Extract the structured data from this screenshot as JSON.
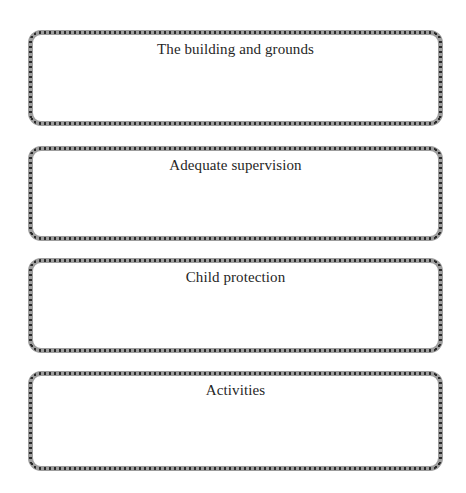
{
  "page": {
    "background_color": "#ffffff",
    "width": 466,
    "height": 493
  },
  "style": {
    "border_band_color": "#9d9d9d",
    "border_dot_color": "#2b2b2b",
    "text_color": "#262626",
    "box_fill_color": "#ffffff"
  },
  "boxes": [
    {
      "label": "The building and grounds",
      "top": 30,
      "height": 96,
      "answer_text": ""
    },
    {
      "label": "Adequate supervision",
      "top": 146,
      "height": 95,
      "answer_text": ""
    },
    {
      "label": "Child protection",
      "top": 258,
      "height": 95,
      "answer_text": ""
    },
    {
      "label": "Activities",
      "top": 371,
      "height": 100,
      "answer_text": ""
    }
  ]
}
